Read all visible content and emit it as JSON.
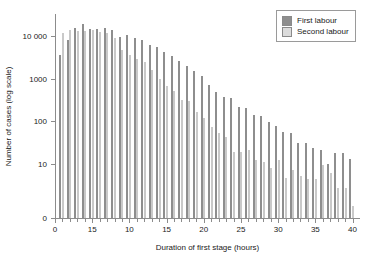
{
  "chart_data": {
    "type": "bar",
    "title": "",
    "xlabel": "Duration of first stage (hours)",
    "ylabel": "Number of cases (log scale)",
    "yscale": "log",
    "grid": false,
    "legend_position": "top-right",
    "x_tick_labels": [
      "0",
      "15",
      "10",
      "15",
      "20",
      "25",
      "30",
      "35",
      "40"
    ],
    "x_tick_values": [
      0,
      5,
      10,
      15,
      20,
      25,
      30,
      35,
      40
    ],
    "y_tick_labels": [
      "0",
      "10",
      "100",
      "1000",
      "10 000"
    ],
    "y_tick_values": [
      0,
      10,
      100,
      1000,
      10000
    ],
    "ylim": [
      0,
      30000
    ],
    "xlim": [
      0,
      41
    ],
    "categories": [
      1,
      2,
      3,
      4,
      5,
      6,
      7,
      8,
      9,
      10,
      11,
      12,
      13,
      14,
      15,
      16,
      17,
      18,
      19,
      20,
      21,
      22,
      23,
      24,
      25,
      26,
      27,
      28,
      29,
      30,
      31,
      32,
      33,
      34,
      35,
      36,
      37,
      38,
      39,
      40
    ],
    "series": [
      {
        "name": "First labour",
        "color": "#8e8e8e",
        "values": [
          3500,
          8200,
          15500,
          19000,
          15000,
          14500,
          15500,
          14000,
          9500,
          10500,
          9000,
          8000,
          6000,
          5500,
          4200,
          3400,
          2600,
          2000,
          1500,
          1150,
          700,
          480,
          370,
          340,
          210,
          200,
          135,
          130,
          95,
          75,
          55,
          53,
          31,
          30,
          23,
          21,
          10,
          18,
          18,
          13
        ]
      },
      {
        "name": "Second labour",
        "color": "#c9c9c9",
        "values": [
          11500,
          13500,
          13000,
          13000,
          14000,
          12500,
          12000,
          9000,
          4700,
          3500,
          2900,
          2400,
          1600,
          1000,
          650,
          500,
          310,
          290,
          160,
          115,
          72,
          52,
          41,
          19,
          19,
          21,
          12,
          11,
          8,
          12,
          4.5,
          7,
          5,
          4.3,
          4.3,
          9,
          6,
          2.7,
          2.7,
          1
        ]
      }
    ]
  },
  "legend": {
    "items": [
      {
        "label": "First labour",
        "swatch": "first"
      },
      {
        "label": "Second labour",
        "swatch": "second"
      }
    ]
  }
}
